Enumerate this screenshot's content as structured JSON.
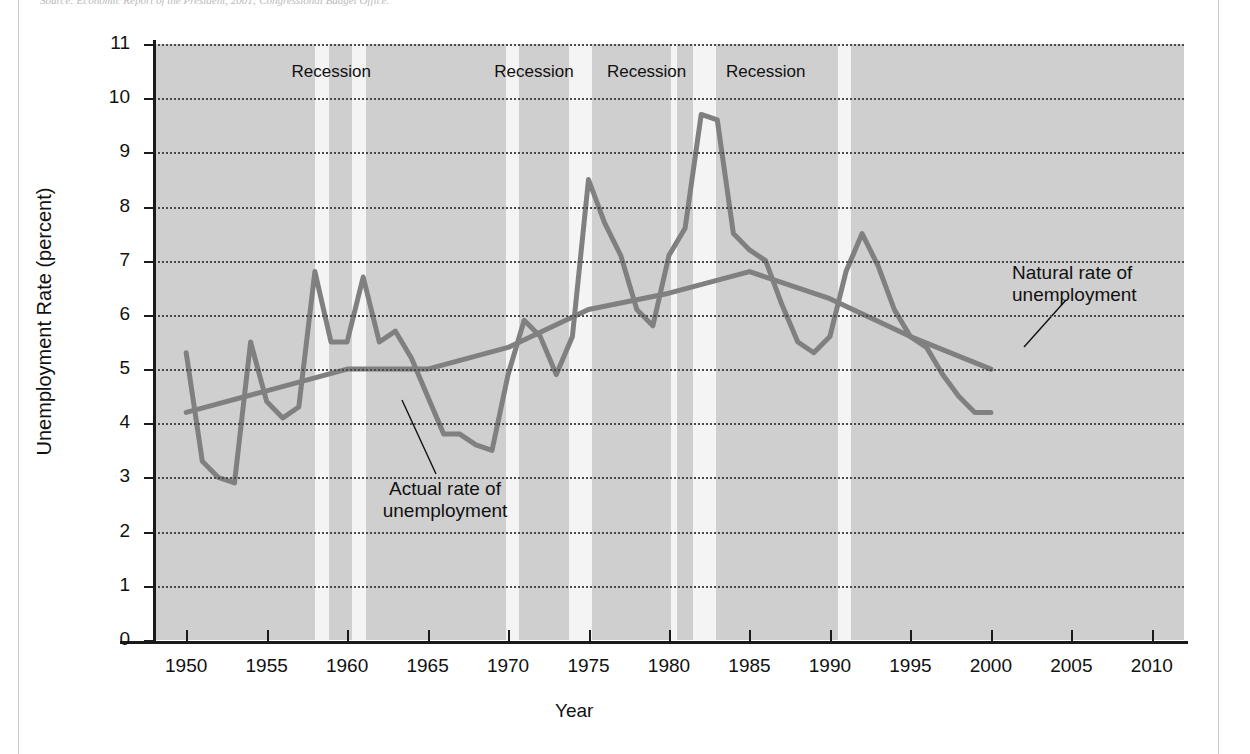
{
  "figure": {
    "source_note": "Source: Economic Report of the President, 2001; Congressional Budget Office.",
    "ylabel": "Unemployment Rate (percent)",
    "xlabel": "Year"
  },
  "annotations": {
    "actual_line1": "Actual rate of",
    "actual_line2": "unemployment",
    "natural_line1": "Natural rate of",
    "natural_line2": "unemployment",
    "recession_label": "Recession"
  },
  "colors": {
    "plot_background": "#cfcfcf",
    "recession_band": "#f4f4f4",
    "series_line": "#808080",
    "axis": "#1a1a1a",
    "gridline": "#4a4a4a",
    "text": "#111111"
  },
  "chart_data": {
    "type": "line",
    "title": "",
    "xlabel": "Year",
    "ylabel": "Unemployment Rate (percent)",
    "xlim": [
      1948,
      2012
    ],
    "ylim": [
      0,
      11
    ],
    "yticks": [
      0,
      1,
      2,
      3,
      4,
      5,
      6,
      7,
      8,
      9,
      10,
      11
    ],
    "xticks": [
      1950,
      1955,
      1960,
      1965,
      1970,
      1975,
      1980,
      1985,
      1990,
      1995,
      2000,
      2005,
      2010
    ],
    "grid": "horizontal-dotted",
    "legend": "annotated-callouts",
    "shaded_regions": [
      {
        "label": "Recession",
        "start": 1958.0,
        "end": 1958.9
      },
      {
        "label": "Recession",
        "start": 1960.3,
        "end": 1961.2
      },
      {
        "label": "Recession",
        "start": 1969.9,
        "end": 1970.7
      },
      {
        "label": "Recession",
        "start": 1973.8,
        "end": 1975.2
      },
      {
        "label": "Recession",
        "start": 1980.1,
        "end": 1980.5
      },
      {
        "label": "Recession",
        "start": 1981.5,
        "end": 1982.9
      },
      {
        "label": "Recession",
        "start": 1990.5,
        "end": 1991.3
      }
    ],
    "recession_text_positions": [
      1959.4,
      1972.0,
      1979.0,
      1986.4
    ],
    "series": [
      {
        "name": "Actual rate of unemployment",
        "x": [
          1950,
          1951,
          1952,
          1953,
          1954,
          1955,
          1956,
          1957,
          1958,
          1959,
          1960,
          1961,
          1962,
          1963,
          1964,
          1965,
          1966,
          1967,
          1968,
          1969,
          1970,
          1971,
          1972,
          1973,
          1974,
          1975,
          1976,
          1977,
          1978,
          1979,
          1980,
          1981,
          1982,
          1983,
          1984,
          1985,
          1986,
          1987,
          1988,
          1989,
          1990,
          1991,
          1992,
          1993,
          1994,
          1995,
          1996,
          1997,
          1998,
          1999,
          2000
        ],
        "values": [
          5.3,
          3.3,
          3.0,
          2.9,
          5.5,
          4.4,
          4.1,
          4.3,
          6.8,
          5.5,
          5.5,
          6.7,
          5.5,
          5.7,
          5.2,
          4.5,
          3.8,
          3.8,
          3.6,
          3.5,
          4.9,
          5.9,
          5.6,
          4.9,
          5.6,
          8.5,
          7.7,
          7.1,
          6.1,
          5.8,
          7.1,
          7.6,
          9.7,
          9.6,
          7.5,
          7.2,
          7.0,
          6.2,
          5.5,
          5.3,
          5.6,
          6.8,
          7.5,
          6.9,
          6.1,
          5.6,
          5.4,
          4.9,
          4.5,
          4.2,
          4.2
        ]
      },
      {
        "name": "Natural rate of unemployment",
        "x": [
          1950,
          1955,
          1960,
          1965,
          1970,
          1975,
          1980,
          1985,
          1990,
          1995,
          2000
        ],
        "values": [
          4.2,
          4.6,
          5.0,
          5.0,
          5.4,
          6.1,
          6.4,
          6.8,
          6.3,
          5.6,
          5.0
        ]
      }
    ]
  }
}
